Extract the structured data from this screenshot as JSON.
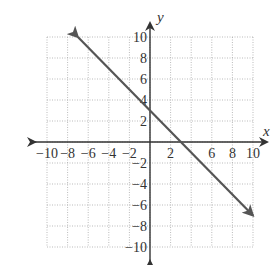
{
  "chart_data": {
    "type": "line",
    "title": "",
    "xlabel": "x",
    "ylabel": "y",
    "xlim": [
      -10,
      10
    ],
    "ylim": [
      -10,
      10
    ],
    "grid": true,
    "grid_style": "dotted",
    "grid_step": 2,
    "x_ticks": [
      -10,
      -8,
      -6,
      -4,
      -2,
      2,
      6,
      8,
      10
    ],
    "y_ticks": [
      10,
      8,
      6,
      4,
      2,
      -2,
      -4,
      -6,
      -8,
      -10
    ],
    "x_tick_labels": [
      "−10",
      "−8",
      "−6",
      "−4",
      "−2",
      "2",
      "6",
      "8",
      "10"
    ],
    "y_tick_labels": [
      "10",
      "8",
      "6",
      "4",
      "2",
      "−2",
      "−4",
      "−6",
      "−8",
      "−10"
    ],
    "series": [
      {
        "name": "line",
        "equation": "y = -x + 3",
        "equation_source": "inferred from visual estimate of intercepts; not labeled in image",
        "slope": -1,
        "y_intercept": 3,
        "x_intercept": 3,
        "x": [
          -7,
          10
        ],
        "y": [
          10,
          -7
        ],
        "arrows": "both ends",
        "color": "#555555"
      }
    ],
    "legend": null
  },
  "colors": {
    "axis": "#333333",
    "grid": "#aaaaaa",
    "line": "#555555",
    "text": "#333333"
  }
}
